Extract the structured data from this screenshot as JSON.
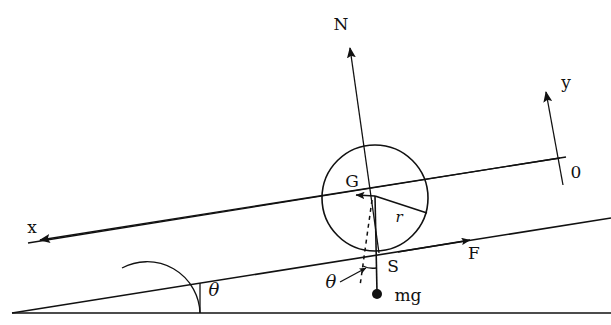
{
  "figure": {
    "title_present": false,
    "background_color": "#ffffff",
    "ink_color": "#111111",
    "labels": {
      "normal_force": "N",
      "y_axis": "y",
      "x_axis": "x",
      "origin": "0",
      "friction_force": "F",
      "center_of_gravity": "G",
      "radius": "r",
      "contact_point": "S",
      "weight": "mg",
      "incline_angle": "θ",
      "weight_angle": "θ"
    },
    "geometry": {
      "ground_line": {
        "x1": 12,
        "y1": 313,
        "x2": 611,
        "y2": 313
      },
      "incline_lower_line": {
        "x1": 12,
        "y1": 313,
        "x2": 611,
        "y2": 218
      },
      "incline_upper_line": {
        "x1": 16,
        "y1": 243,
        "x2": 566,
        "y2": 157
      },
      "incline_vertex": {
        "x": 12,
        "y": 313
      },
      "angle_arc_radius": 52,
      "angle_arc_vertical_x": 200,
      "circle": {
        "cx": 375,
        "cy": 198,
        "r": 53
      },
      "contact_point": {
        "x": 378,
        "y": 251
      },
      "center_point": {
        "x": 375,
        "y": 196
      },
      "normal_arrow": {
        "x1": 378,
        "y1": 251,
        "x2": 349,
        "y2": 44
      },
      "weight_line": {
        "x1": 375,
        "y1": 196,
        "x2": 377,
        "y2": 293
      },
      "weight_dot": {
        "x": 377,
        "y": 294,
        "r": 5
      },
      "radius_line": {
        "x1": 375,
        "y1": 196,
        "x2": 426,
        "y2": 213
      },
      "gravity_component_arrow": {
        "x1": 375,
        "y1": 196,
        "x2": 352,
        "y2": 195
      },
      "dashed_line": {
        "x1": 372,
        "y1": 199,
        "x2": 361,
        "y2": 285
      },
      "y_axis_arrow": {
        "x1": 562,
        "y1": 182,
        "x2": 545,
        "y2": 88
      },
      "x_axis_arrow": {
        "x1": 566,
        "y1": 157,
        "x2": 36,
        "y2": 241
      },
      "friction_arrow_tip": {
        "x": 466,
        "y": 237
      }
    }
  }
}
